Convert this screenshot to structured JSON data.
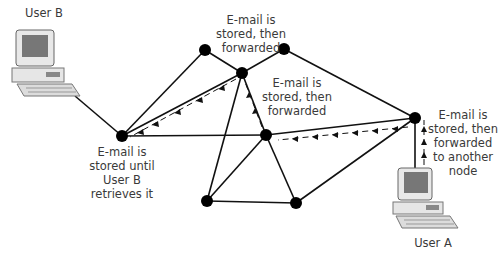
{
  "diagram": {
    "labels": {
      "user_b": "User B",
      "user_a": "User A",
      "stored_until": [
        "E-mail is",
        "stored until",
        "User B",
        "retrieves it"
      ],
      "top_forward": [
        "E-mail is",
        "stored, then",
        "forwarded"
      ],
      "mid_forward": [
        "E-mail is",
        "stored, then",
        "forwarded"
      ],
      "right_forward": [
        "E-mail is",
        "stored, then",
        "forwarded",
        "to another",
        "node"
      ]
    },
    "nodes": [
      {
        "id": "n1",
        "x": 122,
        "y": 136
      },
      {
        "id": "n2",
        "x": 205,
        "y": 50
      },
      {
        "id": "n3",
        "x": 242,
        "y": 73
      },
      {
        "id": "n4",
        "x": 284,
        "y": 49
      },
      {
        "id": "n5",
        "x": 266,
        "y": 135
      },
      {
        "id": "n6",
        "x": 415,
        "y": 118
      },
      {
        "id": "n7",
        "x": 207,
        "y": 201
      },
      {
        "id": "n8",
        "x": 296,
        "y": 203
      }
    ],
    "edges": [
      [
        "n1",
        "n2"
      ],
      [
        "n2",
        "n3"
      ],
      [
        "n3",
        "n4"
      ],
      [
        "n4",
        "n6"
      ],
      [
        "n1",
        "n3"
      ],
      [
        "n1",
        "n5"
      ],
      [
        "n3",
        "n5"
      ],
      [
        "n3",
        "n7"
      ],
      [
        "n5",
        "n6"
      ],
      [
        "n5",
        "n7"
      ],
      [
        "n5",
        "n8"
      ],
      [
        "n7",
        "n8"
      ],
      [
        "n8",
        "n6"
      ]
    ],
    "colors": {
      "line": "#111111",
      "node": "#000000",
      "text": "#3a3a3a"
    }
  }
}
